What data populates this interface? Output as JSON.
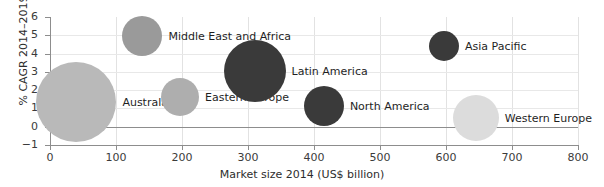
{
  "chart_data": {
    "type": "scatter",
    "title": "",
    "xlabel": "Market size 2014 (US$ billion)",
    "ylabel": "% CAGR 2014–2019",
    "xlim": [
      0,
      800
    ],
    "ylim": [
      -1,
      6
    ],
    "xticks": [
      "0",
      "100",
      "200",
      "300",
      "400",
      "500",
      "600",
      "700",
      "800"
    ],
    "yticks": [
      "-1",
      "0",
      "1",
      "2",
      "3",
      "4",
      "5",
      "6"
    ],
    "grid": true,
    "legend": "none",
    "points": [
      {
        "label": "Australasia",
        "x": 40,
        "y": 1.35,
        "size": 40,
        "color": "#b9b9b9"
      },
      {
        "label": "Middle East and Africa",
        "x": 140,
        "y": 4.95,
        "size": 20,
        "color": "#9a9a9a"
      },
      {
        "label": "Eastern Europe",
        "x": 197,
        "y": 1.6,
        "size": 19,
        "color": "#aeaeae"
      },
      {
        "label": "Latin America",
        "x": 310,
        "y": 3.05,
        "size": 31,
        "color": "#3a3a3a"
      },
      {
        "label": "North America",
        "x": 415,
        "y": 1.15,
        "size": 20,
        "color": "#3a3a3a"
      },
      {
        "label": "Asia Pacific",
        "x": 597,
        "y": 4.4,
        "size": 15,
        "color": "#3a3a3a"
      },
      {
        "label": "Western Europe",
        "x": 645,
        "y": 0.5,
        "size": 23,
        "color": "#dcdcdc"
      }
    ]
  }
}
